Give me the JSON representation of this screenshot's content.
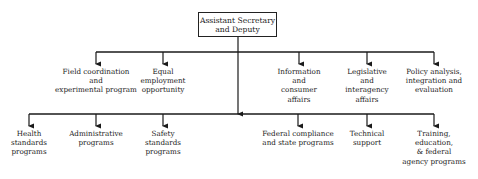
{
  "diagram": {
    "type": "org-chart",
    "root": {
      "lines": [
        "Assistant Secretary",
        "and Deputy"
      ]
    },
    "upper_row": [
      {
        "id": "field",
        "lines": [
          "Field coordination",
          "and",
          "experimental program"
        ],
        "x": 96
      },
      {
        "id": "eeo",
        "lines": [
          "Equal",
          "employment",
          "opportunity"
        ],
        "x": 163
      },
      {
        "id": "info",
        "lines": [
          "Information",
          "and",
          "consumer",
          "affairs"
        ],
        "x": 299
      },
      {
        "id": "legis",
        "lines": [
          "Legislative",
          "and",
          "interagency",
          "affairs"
        ],
        "x": 367
      },
      {
        "id": "policy",
        "lines": [
          "Policy analysis,",
          "integration and",
          "evaluation"
        ],
        "x": 434
      }
    ],
    "lower_row": [
      {
        "id": "health",
        "lines": [
          "Health",
          "standards",
          "programs"
        ],
        "x": 29
      },
      {
        "id": "admin",
        "lines": [
          "Administrative",
          "programs"
        ],
        "x": 96
      },
      {
        "id": "safety",
        "lines": [
          "Safety",
          "standards",
          "programs"
        ],
        "x": 163
      },
      {
        "id": "federal",
        "lines": [
          "Federal compliance",
          "and state programs"
        ],
        "x": 298
      },
      {
        "id": "tech",
        "lines": [
          "Technical",
          "support"
        ],
        "x": 367
      },
      {
        "id": "training",
        "lines": [
          "Training,",
          "education,",
          "& federal",
          "agency programs"
        ],
        "x": 434
      }
    ],
    "colors": {
      "line": "#1a1a1a",
      "background": "#ffffff"
    }
  }
}
